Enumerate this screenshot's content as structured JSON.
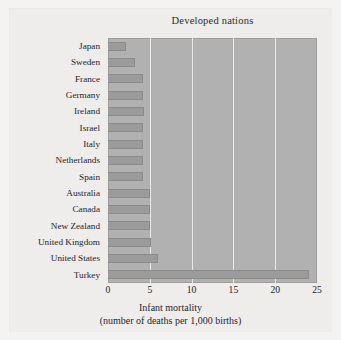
{
  "chart_data": {
    "type": "bar",
    "orientation": "horizontal",
    "title": "Developed nations",
    "xlabel_line1": "Infant mortality",
    "xlabel_line2": "(number of deaths per 1,000 births)",
    "ylabel": "",
    "xlim": [
      0,
      25
    ],
    "xticks": [
      0,
      5,
      10,
      15,
      20,
      25
    ],
    "xtick_labels": [
      "0",
      "5",
      "10",
      "15",
      "20",
      "25"
    ],
    "gridlines_x": [
      5,
      10,
      15,
      20
    ],
    "grid": true,
    "legend": false,
    "categories": [
      "Japan",
      "Sweden",
      "France",
      "Germany",
      "Ireland",
      "Israel",
      "Italy",
      "Netherlands",
      "Spain",
      "Australia",
      "Canada",
      "New Zealand",
      "United Kingdom",
      "United States",
      "Turkey"
    ],
    "values": [
      2.2,
      3.2,
      4.2,
      4.2,
      4.3,
      4.2,
      4.2,
      4.2,
      4.2,
      5.0,
      5.0,
      5.0,
      5.1,
      6.0,
      24.0
    ],
    "colors": {
      "bar_fill": "#9b9b9b",
      "bar_edge": "#8a8a8a",
      "plot_background": "#b1b1b1",
      "gridline": "#f0efed",
      "page_background": "#f4f3f1",
      "text": "#24242a"
    }
  }
}
